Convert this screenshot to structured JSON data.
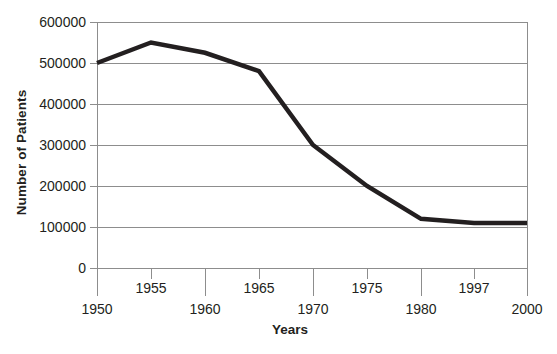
{
  "chart_data": {
    "type": "line",
    "title": "",
    "xlabel": "Years",
    "ylabel": "Number of Patients",
    "x": [
      1950,
      1955,
      1960,
      1965,
      1970,
      1975,
      1980,
      1997,
      2000
    ],
    "categories": [
      "1950",
      "1955",
      "1960",
      "1965",
      "1970",
      "1975",
      "1980",
      "1997",
      "2000"
    ],
    "values": [
      500000,
      550000,
      525000,
      480000,
      300000,
      200000,
      120000,
      110000,
      110000
    ],
    "series": [
      {
        "name": "Number of Patients",
        "values": [
          500000,
          550000,
          525000,
          480000,
          300000,
          200000,
          120000,
          110000,
          110000
        ]
      }
    ],
    "ylim": [
      0,
      600000
    ],
    "ytick_values": [
      600000,
      500000,
      400000,
      300000,
      200000,
      100000,
      0
    ],
    "ytick_labels": [
      "600000",
      "500000",
      "400000",
      "300000",
      "200000",
      "100000",
      "0"
    ],
    "xtick_labels": [
      "1950",
      "1955",
      "1960",
      "1965",
      "1970",
      "1975",
      "1980",
      "1997",
      "2000"
    ],
    "grid": "horizontal",
    "legend": "none",
    "line_color": "#231f20",
    "grid_color": "#8d8d8d",
    "axis_color": "#8d8d8d",
    "background_color": "#ffffff"
  },
  "axes": {
    "y_title": "Number of Patients",
    "x_title": "Years"
  },
  "y_ticks": [
    {
      "label": "600000"
    },
    {
      "label": "500000"
    },
    {
      "label": "400000"
    },
    {
      "label": "300000"
    },
    {
      "label": "200000"
    },
    {
      "label": "100000"
    },
    {
      "label": "0"
    }
  ],
  "x_ticks": [
    {
      "label": "1950",
      "row": "bottom"
    },
    {
      "label": "1955",
      "row": "top"
    },
    {
      "label": "1960",
      "row": "bottom"
    },
    {
      "label": "1965",
      "row": "top"
    },
    {
      "label": "1970",
      "row": "bottom"
    },
    {
      "label": "1975",
      "row": "top"
    },
    {
      "label": "1980",
      "row": "bottom"
    },
    {
      "label": "1997",
      "row": "top"
    },
    {
      "label": "2000",
      "row": "bottom"
    }
  ]
}
